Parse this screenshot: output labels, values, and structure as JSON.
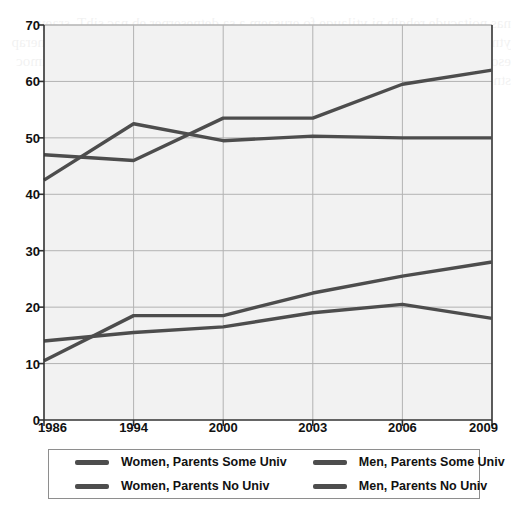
{
  "chart_data": {
    "type": "line",
    "title": "",
    "subtitle": "",
    "xlabel": "",
    "ylabel": "",
    "categories": [
      "1986",
      "1994",
      "2000",
      "2003",
      "2006",
      "2009"
    ],
    "ylim": [
      0,
      70
    ],
    "yticks": [
      0,
      10,
      20,
      30,
      40,
      50,
      60,
      70
    ],
    "grid": true,
    "legend_position": "bottom",
    "series": [
      {
        "name": "Women, Parents Some Univ",
        "color": "#4d4d4d",
        "values": [
          47,
          46,
          53.5,
          53.5,
          59.5,
          62
        ]
      },
      {
        "name": "Men, Parents Some Univ",
        "color": "#4d4d4d",
        "values": [
          42.5,
          52.5,
          49.5,
          50.3,
          50,
          50
        ]
      },
      {
        "name": "Women, Parents No Univ",
        "color": "#4d4d4d",
        "values": [
          10.5,
          18.5,
          18.5,
          22.5,
          25.5,
          28
        ]
      },
      {
        "name": "Men, Parents No Univ",
        "color": "#4d4d4d",
        "values": [
          14,
          15.5,
          16.5,
          19,
          20.5,
          18
        ]
      }
    ]
  },
  "legend": {
    "items": [
      {
        "label": "Women, Parents Some Univ",
        "color": "#4d4d4d"
      },
      {
        "label": "Men, Parents Some Univ",
        "color": "#4d4d4d"
      },
      {
        "label": "Women, Parents No Univ",
        "color": "#4d4d4d"
      },
      {
        "label": "Men, Parents No Univ",
        "color": "#4d4d4d"
      }
    ]
  },
  "style": {
    "plot_background": "#f2f2f2",
    "grid_color": "#b3b3b3",
    "axis_color": "#333333",
    "line_color": "#4d4d4d",
    "text_color": "#111111"
  },
  "background_bleed": "nas noitacude rehgih ni ytilauqe fo erusaem a sa detneserper eb nac sihT .sraey ytnewt tsap eht revo ylbaredisnoc desaercni sah ytisrevinu dednetta ton dah stnerap esohw stneduts fo noitroporp ehT .sdnuorgkcab lanoitacude tnereffid morf gnimoc stneduts fo serahs eht swohs erugif gniwollof ehT"
}
